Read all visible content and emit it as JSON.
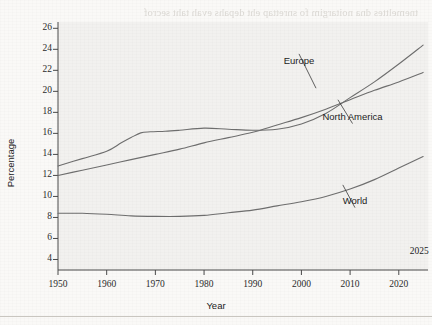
{
  "page": {
    "bleed_through_lines": [
      "tnemelttes dna noitargim fo snrettap eht depahs evah taht secrof",
      "setats eht ni ylralucitrap ,seirtnuoc depoleved ynam ni ,sedaced",
      "ot deunitnoc sah noitalupop nrob-ngierof eht fo erahs eht ,epor",
      "thgilS .seitnuoc eseht ni noitalupop latot eht fo noitroporp a sa",
      "elbaredisnoc a tub ,swolf eseht fo gnimit eht ni tsixe secnereffid",
      "elbisiv a si erugif eht ni nwohs sdnert eht fo yrots nommoc",
      "lasrevinu a ton si esir ehT .srotcaf cimonoce dna lacitilop fo",
      "noitargim ,sedaced tnecer nI .noiger yb seirav ti dna ,nonemonehp",
      "sdnert eseht dna ,semehcs tnemtiurcer ruobal yb nevird neeb sah",
      "erutuf rof snoitacilpmi yek evah ot yleki l era",
      "sroticalp ruobal dna seicilop noitargimmi fo noitcesretni ehT",
      "nrettap lanoiger dna ,yrotsih noitargim fo txetnoc eht ni deweiv",
      "eht ni htworg detcejorp eht ,deednI .tnatropmi ylralucitrap si",
      "rep stnardnuoc eht fo yna naht retsaf si noitalupop nrob-ngierof",
      "cimonoce dna laicos fo egnar ediw a ot setaler sihT .doirep suoiv",
      "dlrow eht fo snoiger ynam ssorca srotcaf"
    ],
    "bottom_rule": true
  },
  "chart_data": {
    "type": "line",
    "title": "",
    "xlabel": "Year",
    "ylabel": "Percentage",
    "xlim": [
      1950,
      2026
    ],
    "ylim": [
      3,
      26.6
    ],
    "xticks": [
      1950,
      1960,
      1970,
      1980,
      1990,
      2000,
      2010,
      2020
    ],
    "xtick_labels": [
      "1950",
      "1960",
      "1970",
      "1980",
      "1990",
      "2000",
      "2010",
      "2020"
    ],
    "yticks": [
      4,
      6,
      8,
      10,
      12,
      14,
      16,
      18,
      20,
      22,
      24,
      26
    ],
    "ytick_labels": [
      "4",
      "6",
      "8",
      "10",
      "12",
      "14",
      "16",
      "18",
      "20",
      "22",
      "24",
      "26"
    ],
    "grid": false,
    "legend_position": "inline-annotations",
    "annotations": [
      {
        "text": "2025",
        "x": 2024.2,
        "y": 4.7
      }
    ],
    "series": [
      {
        "name": "Europe",
        "label_anchor": {
          "x": 1999.5,
          "y": 22.9
        },
        "leader_to": {
          "x": 2003.0,
          "y": 20.3
        },
        "x": [
          1950,
          1955,
          1960,
          1963,
          1965,
          1967,
          1969,
          1972,
          1975,
          1980,
          1985,
          1990,
          1995,
          2000,
          2005,
          2010,
          2015,
          2020,
          2025
        ],
        "y": [
          12.9,
          13.6,
          14.3,
          15.1,
          15.6,
          16.05,
          16.15,
          16.2,
          16.3,
          16.5,
          16.4,
          16.3,
          16.4,
          16.9,
          17.9,
          19.4,
          20.9,
          22.6,
          24.4
        ]
      },
      {
        "name": "North America",
        "label_anchor": {
          "x": 2010.5,
          "y": 17.6
        },
        "leader_to": {
          "x": 2007.5,
          "y": 19.2
        },
        "x": [
          1950,
          1955,
          1960,
          1965,
          1970,
          1975,
          1980,
          1985,
          1990,
          1995,
          2000,
          2005,
          2010,
          2015,
          2020,
          2025
        ],
        "y": [
          12.0,
          12.5,
          13.0,
          13.5,
          14.0,
          14.5,
          15.1,
          15.6,
          16.1,
          16.8,
          17.5,
          18.3,
          19.2,
          20.1,
          20.9,
          21.8
        ]
      },
      {
        "name": "World",
        "label_anchor": {
          "x": 2011.0,
          "y": 9.6
        },
        "leader_to": {
          "x": 2008.5,
          "y": 11.1
        },
        "x": [
          1950,
          1955,
          1960,
          1965,
          1970,
          1975,
          1980,
          1985,
          1990,
          1995,
          2000,
          2005,
          2010,
          2015,
          2020,
          2025
        ],
        "y": [
          8.4,
          8.4,
          8.3,
          8.15,
          8.1,
          8.1,
          8.2,
          8.45,
          8.7,
          9.1,
          9.5,
          10.0,
          10.7,
          11.6,
          12.7,
          13.8
        ]
      }
    ],
    "line_color": "#6e6e6e",
    "plot_background": "#f2f1ef",
    "axis_color": "#4a4a4a"
  }
}
